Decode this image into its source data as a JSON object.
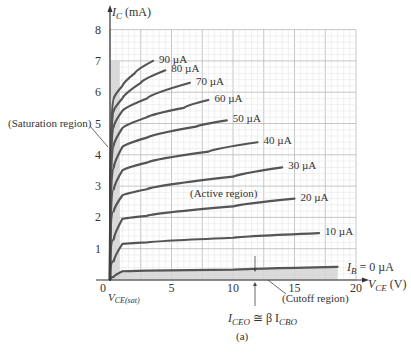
{
  "chart_data": {
    "type": "line",
    "title": "",
    "caption": "(a)",
    "xlabel": "V_CE (V)",
    "ylabel": "I_C (mA)",
    "xlim": [
      0,
      20
    ],
    "ylim": [
      0,
      8
    ],
    "x_ticks": [
      "0",
      "5",
      "10",
      "15",
      "20"
    ],
    "y_ticks": [
      "1",
      "2",
      "3",
      "4",
      "5",
      "6",
      "7",
      "8"
    ],
    "grid": true,
    "series": [
      {
        "name": "IB = 0 µA",
        "label": "I_B = 0 µA",
        "points": [
          [
            0.3,
            0.1
          ],
          [
            1,
            0.28
          ],
          [
            3,
            0.3
          ],
          [
            10,
            0.33
          ],
          [
            18.5,
            0.42
          ]
        ]
      },
      {
        "name": "10 µA",
        "label": "10 µA",
        "points": [
          [
            0.3,
            0.6
          ],
          [
            1,
            1.15
          ],
          [
            3,
            1.2
          ],
          [
            10,
            1.35
          ],
          [
            17,
            1.5
          ]
        ]
      },
      {
        "name": "20 µA",
        "label": "20 µA",
        "points": [
          [
            0.3,
            1.3
          ],
          [
            1,
            1.95
          ],
          [
            3,
            2.05
          ],
          [
            10,
            2.35
          ],
          [
            15,
            2.6
          ]
        ]
      },
      {
        "name": "30 µA",
        "label": "30 µA",
        "points": [
          [
            0.3,
            2.2
          ],
          [
            1,
            2.7
          ],
          [
            3,
            2.9
          ],
          [
            10,
            3.3
          ],
          [
            14,
            3.6
          ]
        ]
      },
      {
        "name": "40 µA",
        "label": "40 µA",
        "points": [
          [
            0.3,
            2.9
          ],
          [
            1,
            3.5
          ],
          [
            3,
            3.75
          ],
          [
            8,
            4.1
          ],
          [
            12,
            4.4
          ]
        ]
      },
      {
        "name": "50 µA",
        "label": "50 µA",
        "points": [
          [
            0.3,
            3.6
          ],
          [
            1,
            4.25
          ],
          [
            3,
            4.55
          ],
          [
            7,
            4.9
          ],
          [
            9.5,
            5.1
          ]
        ]
      },
      {
        "name": "60 µA",
        "label": "60 µA",
        "points": [
          [
            0.3,
            4.3
          ],
          [
            1,
            4.85
          ],
          [
            3,
            5.2
          ],
          [
            6,
            5.5
          ],
          [
            8,
            5.75
          ]
        ]
      },
      {
        "name": "70 µA",
        "label": "70 µA",
        "points": [
          [
            0.3,
            4.9
          ],
          [
            1,
            5.4
          ],
          [
            3,
            5.8
          ],
          [
            6.5,
            6.3
          ]
        ]
      },
      {
        "name": "80 µA",
        "label": "80 µA",
        "points": [
          [
            0.3,
            5.4
          ],
          [
            1,
            5.8
          ],
          [
            2.5,
            6.3
          ],
          [
            4.5,
            6.7
          ]
        ]
      },
      {
        "name": "90 µA",
        "label": "90 µA",
        "points": [
          [
            0.3,
            5.8
          ],
          [
            1,
            6.2
          ],
          [
            2,
            6.6
          ],
          [
            3.5,
            7.0
          ]
        ]
      }
    ],
    "annotations": [
      {
        "text": "(Saturation region)",
        "target": [
          0.4,
          4.2
        ]
      },
      {
        "text": "(Active region)",
        "at": [
          10,
          3.0
        ]
      },
      {
        "text": "(Cutoff region)",
        "target": [
          12.5,
          0.2
        ]
      },
      {
        "text": "V_CE(sat)",
        "at": [
          0.7,
          -0.3
        ]
      },
      {
        "text": "I_CEO ≅ β I_CBO",
        "target": [
          11.5,
          0.3
        ]
      }
    ]
  },
  "labels": {
    "ylabel_main": "I",
    "ylabel_sub": "C",
    "ylabel_unit": " (mA)",
    "xlabel_main": "V",
    "xlabel_sub": "CE",
    "xlabel_unit": " (V)",
    "origin": "0",
    "vcesat_main": "V",
    "vcesat_sub": "CE(sat)",
    "saturation": "(Saturation region)",
    "active": "(Active region)",
    "cutoff": "(Cutoff region)",
    "iceo_main": "I",
    "iceo_sub": "CEO",
    "iceo_rest": " ≅ β I",
    "icbo_sub": "CBO",
    "ib0_main": "I",
    "ib0_sub": "B",
    "ib0_rest": " = 0 µA",
    "caption": "(a)"
  },
  "colors": {
    "curve": "#555555",
    "shade": "#d4d4d4",
    "grid_minor": "#e6e6e6",
    "grid_major": "#b8b8b8",
    "axis": "#333333"
  }
}
